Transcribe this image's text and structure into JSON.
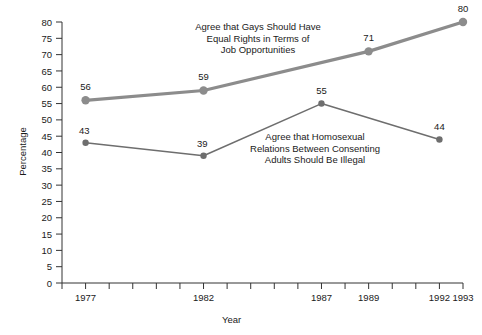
{
  "chart_data": {
    "type": "line",
    "title": "",
    "xlabel": "Year",
    "ylabel": "Percentage",
    "xlim": [
      1976,
      1993
    ],
    "ylim": [
      0,
      80
    ],
    "grid": false,
    "legend_position": "inline-annotations",
    "x_tick_years": [
      1976,
      1977,
      1978,
      1979,
      1980,
      1981,
      1982,
      1983,
      1984,
      1985,
      1986,
      1987,
      1988,
      1989,
      1990,
      1991,
      1992,
      1993
    ],
    "x_tick_labels": [
      {
        "year": 1977,
        "label": "1977"
      },
      {
        "year": 1982,
        "label": "1982"
      },
      {
        "year": 1987,
        "label": "1987"
      },
      {
        "year": 1989,
        "label": "1989"
      },
      {
        "year": 1992,
        "label": "1992"
      },
      {
        "year": 1993,
        "label": "1993"
      }
    ],
    "y_ticks": [
      0,
      5,
      10,
      15,
      20,
      25,
      30,
      35,
      40,
      45,
      50,
      55,
      60,
      65,
      70,
      75,
      80
    ],
    "y_tick_labels": [
      "0",
      "5",
      "10",
      "15",
      "20",
      "25",
      "30",
      "35",
      "40",
      "45",
      "50",
      "55",
      "60",
      "65",
      "70",
      "75",
      "80"
    ],
    "series": [
      {
        "name": "Agree that Gays Should Have Equal Rights in Terms of Job Opportunities",
        "color": "#8c8c8c",
        "line_width": 3.2,
        "marker_size": 4.2,
        "x": [
          1977,
          1982,
          1989,
          1993
        ],
        "values": [
          56,
          59,
          71,
          80
        ],
        "point_labels": [
          "56",
          "59",
          "71",
          "80"
        ]
      },
      {
        "name": "Agree that Homosexual Relations Between Consenting Adults Should Be Illegal",
        "color": "#6e6e6e",
        "line_width": 1.5,
        "marker_size": 3.2,
        "x": [
          1977,
          1982,
          1987,
          1992
        ],
        "values": [
          43,
          39,
          55,
          44
        ],
        "point_labels": [
          "43",
          "39",
          "55",
          "44"
        ]
      }
    ],
    "annotations": [
      {
        "id": "annot-rights",
        "text": "Agree that Gays Should Have\nEqual Rights in Terms of\nJob Opportunities"
      },
      {
        "id": "annot-illegal",
        "text": "Agree that Homosexual\nRelations Between Consenting\nAdults Should Be Illegal"
      }
    ]
  },
  "axes": {
    "x_title": "Year",
    "y_title": "Percentage"
  }
}
